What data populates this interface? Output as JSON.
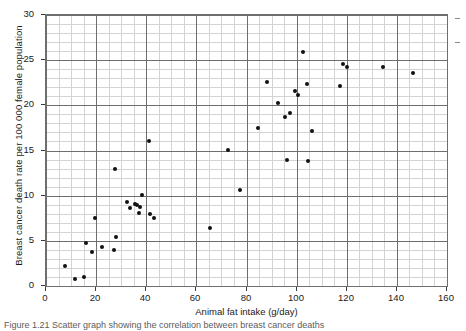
{
  "chart_data": {
    "type": "scatter",
    "title": "",
    "xlabel": "Animal fat intake (g/day)",
    "ylabel": "Breast cancer death rate per 100 000 female population",
    "xlim": [
      0,
      160
    ],
    "ylim": [
      0,
      30
    ],
    "xticks": [
      0,
      20,
      40,
      60,
      80,
      100,
      120,
      140,
      160
    ],
    "yticks": [
      0,
      5,
      10,
      15,
      20,
      25,
      30
    ],
    "x_major_step": 20,
    "x_minor_step": 5,
    "y_major_step": 5,
    "y_minor_step": 1,
    "grid": true,
    "legend": false,
    "marker": "filled-circle",
    "marker_color": "#111111",
    "points": [
      {
        "x": 7.5,
        "y": 2.2
      },
      {
        "x": 11.5,
        "y": 0.8
      },
      {
        "x": 15.0,
        "y": 1.0
      },
      {
        "x": 15.8,
        "y": 4.8
      },
      {
        "x": 18.5,
        "y": 3.8
      },
      {
        "x": 19.5,
        "y": 7.5
      },
      {
        "x": 22.5,
        "y": 4.3
      },
      {
        "x": 27.0,
        "y": 4.0
      },
      {
        "x": 27.5,
        "y": 13.0
      },
      {
        "x": 28.0,
        "y": 5.4
      },
      {
        "x": 32.5,
        "y": 9.3
      },
      {
        "x": 33.5,
        "y": 8.6
      },
      {
        "x": 35.5,
        "y": 9.1
      },
      {
        "x": 36.5,
        "y": 9.0
      },
      {
        "x": 37.0,
        "y": 8.1
      },
      {
        "x": 37.5,
        "y": 8.7
      },
      {
        "x": 38.5,
        "y": 10.1
      },
      {
        "x": 41.5,
        "y": 8.0
      },
      {
        "x": 43.0,
        "y": 7.5
      },
      {
        "x": 41.0,
        "y": 16.0
      },
      {
        "x": 65.5,
        "y": 6.4
      },
      {
        "x": 72.5,
        "y": 15.1
      },
      {
        "x": 77.5,
        "y": 10.6
      },
      {
        "x": 84.5,
        "y": 17.5
      },
      {
        "x": 88.0,
        "y": 22.6
      },
      {
        "x": 92.5,
        "y": 20.3
      },
      {
        "x": 95.5,
        "y": 18.7
      },
      {
        "x": 96.0,
        "y": 13.9
      },
      {
        "x": 97.5,
        "y": 19.2
      },
      {
        "x": 99.5,
        "y": 21.6
      },
      {
        "x": 100.5,
        "y": 21.1
      },
      {
        "x": 102.5,
        "y": 25.9
      },
      {
        "x": 104.0,
        "y": 22.4
      },
      {
        "x": 104.5,
        "y": 13.8
      },
      {
        "x": 106.0,
        "y": 17.2
      },
      {
        "x": 117.5,
        "y": 22.1
      },
      {
        "x": 118.5,
        "y": 24.6
      },
      {
        "x": 120.0,
        "y": 24.2
      },
      {
        "x": 134.5,
        "y": 24.2
      },
      {
        "x": 146.5,
        "y": 23.6
      }
    ]
  },
  "caption": {
    "text": "Figure 1.21 Scatter graph showing the correlation between breast cancer deaths"
  }
}
